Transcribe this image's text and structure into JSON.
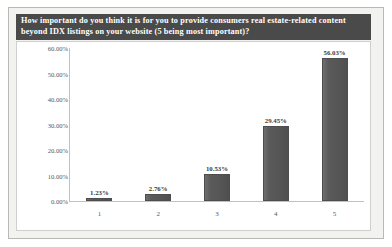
{
  "chart_data": {
    "type": "bar",
    "title": "How important do you think it is for you to provide consumers real estate-related content beyond IDX listings on your website (5 being most important)?",
    "categories": [
      "1",
      "2",
      "3",
      "4",
      "5"
    ],
    "values": [
      1.23,
      2.76,
      10.53,
      29.45,
      56.03
    ],
    "data_labels": [
      "1.23%",
      "2.76%",
      "10.53%",
      "29.45%",
      "56.03%"
    ],
    "xlabel": "",
    "ylabel": "",
    "ylim": [
      0,
      60
    ],
    "ytick_values": [
      0,
      10,
      20,
      30,
      40,
      50,
      60
    ],
    "ytick_labels": [
      "0.00%",
      "10.00%",
      "20.00%",
      "30.00%",
      "40.00%",
      "50.00%",
      "60.00%"
    ],
    "grid": false,
    "legend": false,
    "bar_color": "#565656",
    "plot_background": "#ffffff",
    "panel_background": "#f2f2f0",
    "title_background": "#4a4a4a",
    "title_color": "#ffffff"
  }
}
